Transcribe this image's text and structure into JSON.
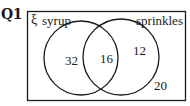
{
  "question": {
    "label": "Q1"
  },
  "venn": {
    "universal_symbol": "ξ",
    "sets": [
      {
        "name": "syrup"
      },
      {
        "name": "sprinkles"
      }
    ],
    "regions": {
      "syrup_only": "32",
      "both": "16",
      "sprinkles_only": "12",
      "neither": "20"
    },
    "colors": {
      "stroke": "#1a1a1a",
      "background": "#ffffff"
    }
  }
}
